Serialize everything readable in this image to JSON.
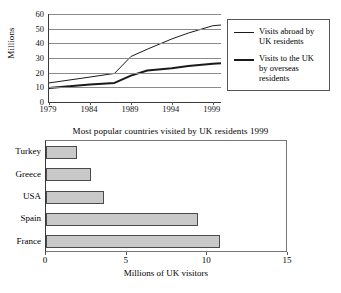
{
  "chart_data": [
    {
      "type": "line",
      "title": "",
      "xlabel": "",
      "ylabel": "Millions",
      "xlim": [
        1979,
        2000
      ],
      "ylim": [
        0,
        60
      ],
      "yticks": [
        0,
        10,
        20,
        30,
        40,
        50,
        60
      ],
      "xticks": [
        1979,
        1984,
        1989,
        1994,
        1999
      ],
      "xtick_labels": [
        "1979",
        "1984",
        "1989",
        "1994",
        "1999"
      ],
      "ytick_labels": [
        "0",
        "10",
        "20",
        "30",
        "40",
        "50",
        "60"
      ],
      "grid": true,
      "legend_position": "right",
      "series": [
        {
          "name": "Visits abroad by UK residents",
          "legend_label": "Visits abroad by\nUK residents",
          "style": "thin",
          "x": [
            1979,
            1984,
            1987,
            1989,
            1991,
            1994,
            1996,
            1999,
            2000
          ],
          "values": [
            13,
            17,
            19.5,
            31,
            36,
            43,
            47,
            52,
            52.5
          ]
        },
        {
          "name": "Visits to the UK by overseas residents",
          "legend_label": "Visits to the UK\nby overseas\nresidents",
          "style": "thick",
          "x": [
            1979,
            1984,
            1987,
            1989,
            1991,
            1994,
            1996,
            1999,
            2000
          ],
          "values": [
            9.5,
            12,
            13,
            18,
            21.5,
            23,
            24.5,
            26,
            26.5
          ]
        }
      ]
    },
    {
      "type": "bar",
      "orientation": "horizontal",
      "title": "Most popular countries visited by UK residents 1999",
      "xlabel": "Millions of UK visitors",
      "ylabel": "",
      "categories": [
        "Turkey",
        "Greece",
        "USA",
        "Spain",
        "France"
      ],
      "values": [
        1.9,
        2.8,
        3.6,
        9.4,
        10.8
      ],
      "xlim": [
        0,
        15
      ],
      "xticks": [
        0,
        5,
        10,
        15
      ],
      "xtick_labels": [
        "0",
        "5",
        "10",
        "15"
      ],
      "grid": false,
      "bar_fill": "#c9c9c9",
      "bar_border": "#4a4a4a"
    }
  ],
  "line_chart": {
    "y_axis_title": "Millions",
    "legend": [
      {
        "label": "Visits abroad by\nUK residents",
        "style": "thin"
      },
      {
        "label": "Visits to the UK\nby overseas\nresidents",
        "style": "thick"
      }
    ]
  },
  "bar_chart": {
    "title": "Most popular countries visited by UK residents 1999",
    "x_axis_title": "Millions of UK visitors"
  },
  "colors": {
    "line": "#1a1a1a",
    "grid": "#8a8a8a",
    "axis": "#3a3a3a",
    "bar_fill": "#c9c9c9",
    "bar_border": "#4a4a4a",
    "background": "#ffffff"
  }
}
